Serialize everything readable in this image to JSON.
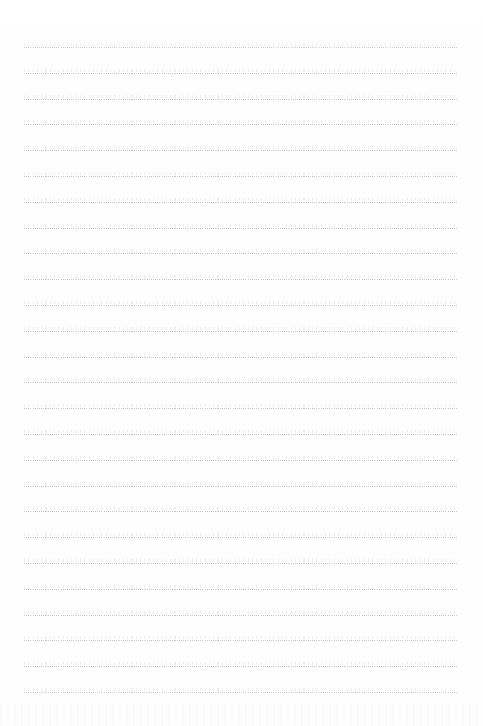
{
  "document": {
    "kind": "ruled-notebook-page",
    "title": "Blank Ruled Page",
    "written_text": "",
    "header_text": "",
    "footer_text": "",
    "page_number": ""
  },
  "canvas": {
    "width": 483,
    "height": 726,
    "background_color": "#fefefe"
  },
  "ruling": {
    "style": "dotted",
    "line_color": "#c4c4ca",
    "line_thickness_px": 1,
    "dot_pitch_px": 2.15,
    "line_count": 26,
    "first_line_y": 47,
    "line_spacing_px": 25.8,
    "left_margin_x": 24,
    "right_margin_x": 458,
    "line_length_px": 434,
    "top_margin_px": 47,
    "bottom_margin_px": 34,
    "vertical_margin_rule": "none"
  },
  "lines": [
    {
      "index": 1,
      "y": 47,
      "content": ""
    },
    {
      "index": 2,
      "y": 73,
      "content": ""
    },
    {
      "index": 3,
      "y": 99,
      "content": ""
    },
    {
      "index": 4,
      "y": 124,
      "content": ""
    },
    {
      "index": 5,
      "y": 150,
      "content": ""
    },
    {
      "index": 6,
      "y": 176,
      "content": ""
    },
    {
      "index": 7,
      "y": 202,
      "content": ""
    },
    {
      "index": 8,
      "y": 228,
      "content": ""
    },
    {
      "index": 9,
      "y": 253,
      "content": ""
    },
    {
      "index": 10,
      "y": 279,
      "content": ""
    },
    {
      "index": 11,
      "y": 305,
      "content": ""
    },
    {
      "index": 12,
      "y": 331,
      "content": ""
    },
    {
      "index": 13,
      "y": 357,
      "content": ""
    },
    {
      "index": 14,
      "y": 382,
      "content": ""
    },
    {
      "index": 15,
      "y": 408,
      "content": ""
    },
    {
      "index": 16,
      "y": 434,
      "content": ""
    },
    {
      "index": 17,
      "y": 460,
      "content": ""
    },
    {
      "index": 18,
      "y": 486,
      "content": ""
    },
    {
      "index": 19,
      "y": 511,
      "content": ""
    },
    {
      "index": 20,
      "y": 537,
      "content": ""
    },
    {
      "index": 21,
      "y": 563,
      "content": ""
    },
    {
      "index": 22,
      "y": 589,
      "content": ""
    },
    {
      "index": 23,
      "y": 615,
      "content": ""
    },
    {
      "index": 24,
      "y": 640,
      "content": ""
    },
    {
      "index": 25,
      "y": 666,
      "content": ""
    },
    {
      "index": 26,
      "y": 692,
      "content": ""
    }
  ]
}
